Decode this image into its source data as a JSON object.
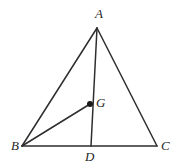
{
  "figure": {
    "width": 179,
    "height": 166,
    "background_color": "#ffffff",
    "line_color": "#2e2e2e",
    "label_color": "#1f1f1f",
    "dot_color": "#1a1a1a",
    "points": [
      {
        "id": "A",
        "label": "A",
        "x": 97,
        "y": 28,
        "label_x": 95,
        "label_y": 7,
        "has_dot": false
      },
      {
        "id": "B",
        "label": "B",
        "x": 22,
        "y": 146,
        "label_x": 11,
        "label_y": 139,
        "has_dot": false
      },
      {
        "id": "C",
        "label": "C",
        "x": 157,
        "y": 146,
        "label_x": 161,
        "label_y": 139,
        "has_dot": false
      },
      {
        "id": "D",
        "label": "D",
        "x": 91,
        "y": 146,
        "label_x": 85,
        "label_y": 150,
        "has_dot": false
      },
      {
        "id": "G",
        "label": "G",
        "x": 90,
        "y": 104,
        "label_x": 96,
        "label_y": 96,
        "has_dot": true
      }
    ],
    "segments": [
      {
        "id": "AB",
        "from": "A",
        "to": "B",
        "x1": 97,
        "y1": 28,
        "x2": 22,
        "y2": 146
      },
      {
        "id": "AC",
        "from": "A",
        "to": "C",
        "x1": 97,
        "y1": 28,
        "x2": 157,
        "y2": 146
      },
      {
        "id": "BC",
        "from": "B",
        "to": "C",
        "x1": 22,
        "y1": 146,
        "x2": 157,
        "y2": 146
      },
      {
        "id": "AD",
        "from": "A",
        "to": "D",
        "x1": 97,
        "y1": 28,
        "x2": 91,
        "y2": 146
      },
      {
        "id": "BG",
        "from": "B",
        "to": "G",
        "x1": 22,
        "y1": 146,
        "x2": 90,
        "y2": 104
      }
    ],
    "dot_radius": 3
  }
}
